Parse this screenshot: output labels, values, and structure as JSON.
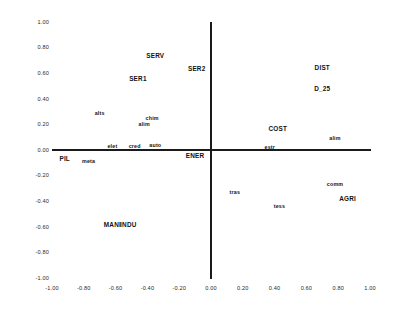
{
  "chart_data": {
    "type": "scatter",
    "title": "",
    "subtitle": "",
    "xlabel": "",
    "ylabel": "",
    "xlim": [
      -1.0,
      1.0
    ],
    "ylim": [
      -1.0,
      1.0
    ],
    "grid": false,
    "legend": "none",
    "axes_style": "crossed-at-origin",
    "xticks": [
      "-1.00",
      "-0.80",
      "-0.60",
      "-0.40",
      "-0.20",
      "0.00",
      "0.20",
      "0.40",
      "0.60",
      "0.80",
      "1.00"
    ],
    "xtick_values": [
      -1.0,
      -0.8,
      -0.6,
      -0.4,
      -0.2,
      0.0,
      0.2,
      0.4,
      0.6,
      0.8,
      1.0
    ],
    "yticks": [
      "1.00",
      "0.80",
      "0.60",
      "0.40",
      "0.20",
      "0.00",
      "-0.20",
      "-0.40",
      "-0.60",
      "-0.80",
      "-1.00"
    ],
    "ytick_values": [
      1.0,
      0.8,
      0.6,
      0.4,
      0.2,
      0.0,
      -0.2,
      -0.4,
      -0.6,
      -0.8,
      -1.0
    ],
    "points": [
      {
        "label": "SERV",
        "x": -0.35,
        "y": 0.74,
        "size": "major"
      },
      {
        "label": "SER2",
        "x": -0.09,
        "y": 0.64,
        "size": "major"
      },
      {
        "label": "DIST",
        "x": 0.7,
        "y": 0.65,
        "size": "major"
      },
      {
        "label": "SER1",
        "x": -0.46,
        "y": 0.56,
        "size": "major"
      },
      {
        "label": "D_25",
        "x": 0.7,
        "y": 0.48,
        "size": "major"
      },
      {
        "label": "alts",
        "x": -0.7,
        "y": 0.29,
        "size": "minor"
      },
      {
        "label": "chim",
        "x": -0.37,
        "y": 0.25,
        "size": "minor"
      },
      {
        "label": "alim",
        "x": -0.42,
        "y": 0.2,
        "size": "minor"
      },
      {
        "label": "COST",
        "x": 0.42,
        "y": 0.17,
        "size": "major"
      },
      {
        "label": "alim",
        "x": 0.78,
        "y": 0.09,
        "size": "minor"
      },
      {
        "label": "elet",
        "x": -0.62,
        "y": 0.03,
        "size": "minor"
      },
      {
        "label": "cred",
        "x": -0.48,
        "y": 0.03,
        "size": "minor"
      },
      {
        "label": "auto",
        "x": -0.35,
        "y": 0.04,
        "size": "minor"
      },
      {
        "label": "estr",
        "x": 0.37,
        "y": 0.02,
        "size": "minor"
      },
      {
        "label": "ENER",
        "x": -0.1,
        "y": -0.04,
        "size": "major"
      },
      {
        "label": "PIL",
        "x": -0.92,
        "y": -0.06,
        "size": "major"
      },
      {
        "label": "meta",
        "x": -0.77,
        "y": -0.09,
        "size": "minor"
      },
      {
        "label": "comm",
        "x": 0.78,
        "y": -0.27,
        "size": "minor"
      },
      {
        "label": "tras",
        "x": 0.15,
        "y": -0.33,
        "size": "minor"
      },
      {
        "label": "AGRI",
        "x": 0.86,
        "y": -0.38,
        "size": "major"
      },
      {
        "label": "tess",
        "x": 0.43,
        "y": -0.44,
        "size": "minor"
      },
      {
        "label": "MANI",
        "x": -0.62,
        "y": -0.58,
        "size": "major"
      },
      {
        "label": "INDU",
        "x": -0.52,
        "y": -0.58,
        "size": "major"
      }
    ]
  },
  "colors": {
    "axis": "#1a1a1a",
    "text": "#111111",
    "tick_text": "#2b2b2b",
    "background": "#ffffff"
  }
}
